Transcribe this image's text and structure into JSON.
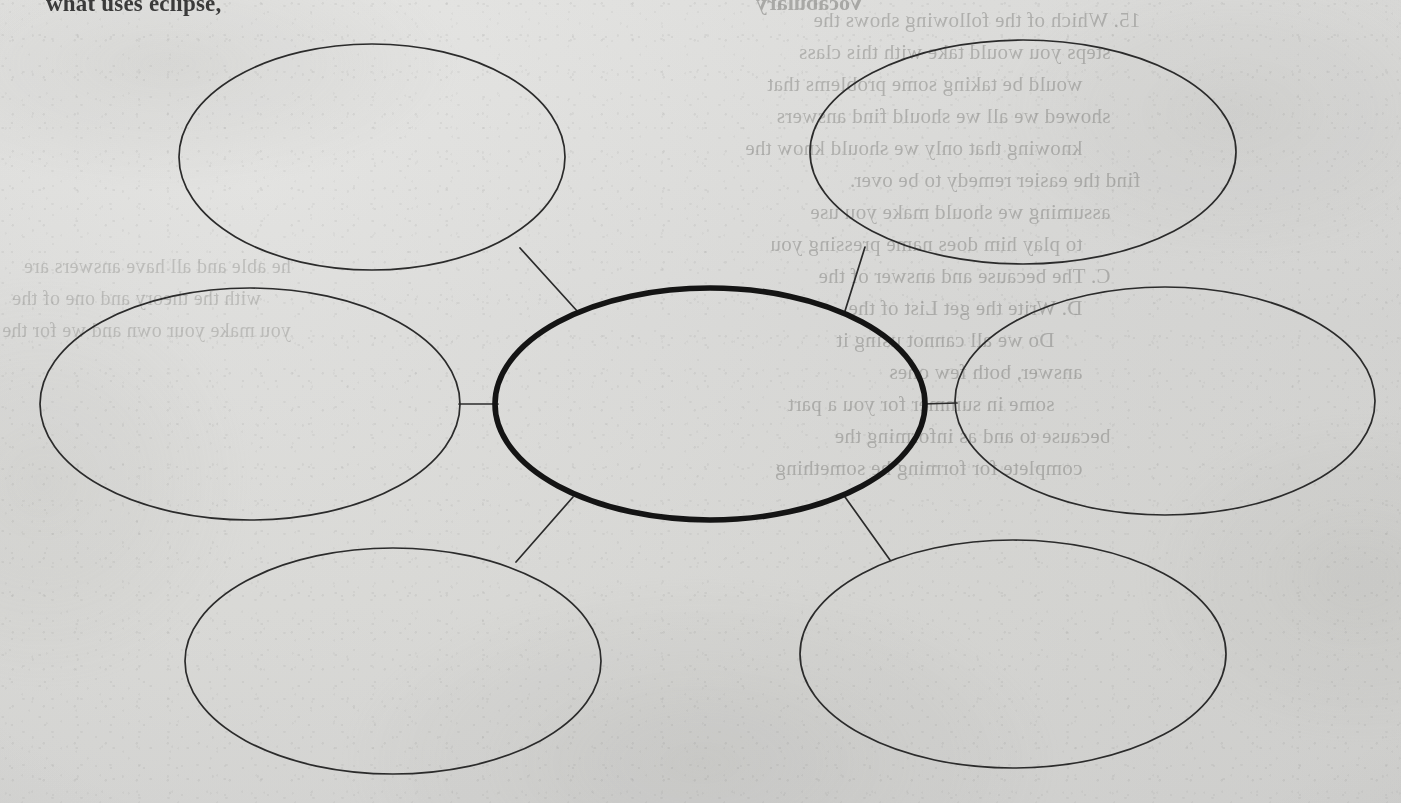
{
  "page": {
    "width": 1401,
    "height": 803,
    "paper_color": "#ededec",
    "ink_color": "#2b2b2b",
    "center_ink_color": "#141414",
    "header_text": "what uses eclipse,",
    "header_bleed_text": "Vocabulary"
  },
  "diagram": {
    "type": "bubble-concept-map",
    "title": "",
    "center": {
      "id": "center",
      "label": "",
      "cx": 710,
      "cy": 404,
      "rx": 215,
      "ry": 116,
      "emphasis": "bold"
    },
    "nodes": [
      {
        "id": "top-left",
        "label": "",
        "cx": 372,
        "cy": 157,
        "rx": 193,
        "ry": 113,
        "emphasis": "thin"
      },
      {
        "id": "top-right",
        "label": "",
        "cx": 1023,
        "cy": 152,
        "rx": 213,
        "ry": 112,
        "emphasis": "thin"
      },
      {
        "id": "middle-left",
        "label": "",
        "cx": 250,
        "cy": 404,
        "rx": 210,
        "ry": 116,
        "emphasis": "thin"
      },
      {
        "id": "middle-right",
        "label": "",
        "cx": 1165,
        "cy": 401,
        "rx": 210,
        "ry": 114,
        "emphasis": "thin"
      },
      {
        "id": "bottom-left",
        "label": "",
        "cx": 393,
        "cy": 661,
        "rx": 208,
        "ry": 113,
        "emphasis": "thin"
      },
      {
        "id": "bottom-right",
        "label": "",
        "cx": 1013,
        "cy": 654,
        "rx": 213,
        "ry": 114,
        "emphasis": "thin"
      }
    ],
    "connectors": [
      {
        "id": "link-top-left",
        "from": "top-left",
        "to": "center",
        "x1": 520,
        "y1": 248,
        "x2": 578,
        "y2": 312
      },
      {
        "id": "link-top-right",
        "from": "top-right",
        "to": "center",
        "x1": 865,
        "y1": 247,
        "x2": 845,
        "y2": 311
      },
      {
        "id": "link-middle-left",
        "from": "middle-left",
        "to": "center",
        "x1": 459,
        "y1": 404,
        "x2": 496,
        "y2": 404
      },
      {
        "id": "link-middle-right",
        "from": "middle-right",
        "to": "center",
        "x1": 924,
        "y1": 404,
        "x2": 956,
        "y2": 403
      },
      {
        "id": "link-bottom-left",
        "from": "bottom-left",
        "to": "center",
        "x1": 573,
        "y1": 497,
        "x2": 516,
        "y2": 562
      },
      {
        "id": "link-bottom-right",
        "from": "bottom-right",
        "to": "center",
        "x1": 845,
        "y1": 497,
        "x2": 890,
        "y2": 560
      }
    ]
  },
  "bleed_through": {
    "note": "faint mirrored show-through text from the reverse side of the sheet",
    "right_column": [
      "15. Which of the following shows the",
      "steps you would take with this class",
      "would be taking some problems that",
      "showed we all we should find answers",
      "knowing that only we should know the",
      "find the easier remedy to be over.",
      "assuming we should make you use",
      "to play him does name pressing you",
      "C. The because and answer of the",
      "D. Write the get List of the",
      "Do we all cannot using it",
      "answer, both few ones",
      "some in summer for you a part",
      "because to and as informing the",
      "complete for forming he something"
    ],
    "left_column": [
      "he able and all have answers are",
      "with the theory and one of the",
      "you make your own and we for the"
    ]
  }
}
